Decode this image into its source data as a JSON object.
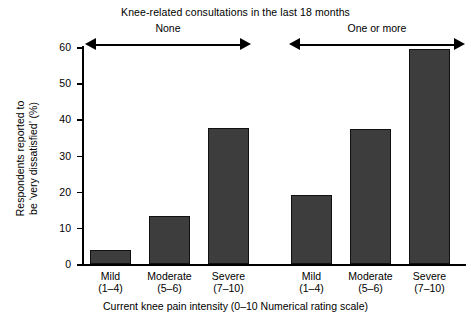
{
  "chart_data": {
    "type": "bar",
    "title": "",
    "group_title": "Knee-related consultations in the last 18 months",
    "xlabel": "Current knee pain intensity (0–10 Numerical rating scale)",
    "ylabel_line1": "Respondents reported to",
    "ylabel_line2": "be ‘very dissatisfied’ (%)",
    "ylim": [
      0,
      60
    ],
    "ytick_labels": [
      "0",
      "10",
      "20",
      "30",
      "40",
      "50",
      "60"
    ],
    "ytick_values": [
      0,
      10,
      20,
      30,
      40,
      50,
      60
    ],
    "grid": false,
    "legend": "none",
    "bar_color": "#3d3d3d",
    "groups": [
      {
        "label": "None",
        "categories": [
          {
            "name": "Mild",
            "range": "(1–4)",
            "value": 4.0
          },
          {
            "name": "Moderate",
            "range": "(5–6)",
            "value": 13.3
          },
          {
            "name": "Severe",
            "range": "(7–10)",
            "value": 37.6
          }
        ]
      },
      {
        "label": "One or more",
        "categories": [
          {
            "name": "Mild",
            "range": "(1–4)",
            "value": 19.0
          },
          {
            "name": "Moderate",
            "range": "(5–6)",
            "value": 37.3
          },
          {
            "name": "Severe",
            "range": "(7–10)",
            "value": 59.5
          }
        ]
      }
    ],
    "categories": [
      "Mild (1–4)",
      "Moderate (5–6)",
      "Severe (7–10)",
      "Mild (1–4)",
      "Moderate (5–6)",
      "Severe (7–10)"
    ],
    "values": [
      4.0,
      13.3,
      37.6,
      19.0,
      37.3,
      59.5
    ]
  }
}
